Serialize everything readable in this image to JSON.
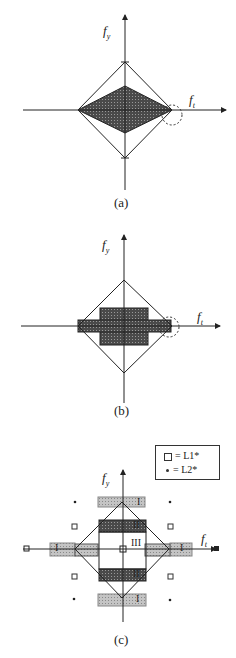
{
  "figure": {
    "panels": [
      {
        "id": "a",
        "caption": "(a)",
        "x_axis_label": "f",
        "x_axis_sub": "t",
        "y_axis_label": "f",
        "y_axis_sub": "y"
      },
      {
        "id": "b",
        "caption": "(b)",
        "x_axis_label": "f",
        "x_axis_sub": "t",
        "y_axis_label": "f",
        "y_axis_sub": "y"
      },
      {
        "id": "c",
        "caption": "(c)",
        "x_axis_label": "f",
        "x_axis_sub": "t",
        "y_axis_label": "f",
        "y_axis_sub": "y"
      }
    ],
    "legend": {
      "items": [
        {
          "symbol": "square",
          "text": "= L1*"
        },
        {
          "symbol": "dot",
          "text": "= L2*"
        }
      ]
    },
    "regions": {
      "I": "I",
      "II": "II",
      "III": "III"
    },
    "colors": {
      "line": "#222222",
      "shade_dark": "#555555",
      "shade_light": "#b8b8b8"
    }
  }
}
